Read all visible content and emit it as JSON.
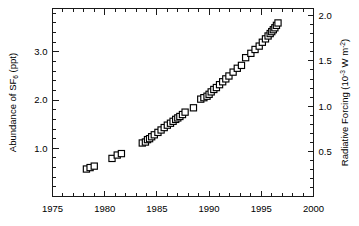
{
  "chart_data": {
    "type": "scatter",
    "title": "",
    "xlabel": "",
    "ylabel": "Abundance of SF6 (ppt)",
    "y2label": "Radiative Forcing (10-3 W m-2)",
    "ylabel_parts": {
      "prefix": "Abundance of SF",
      "subscript": "6",
      "suffix": " (ppt)"
    },
    "y2label_parts": {
      "prefix": "Radiative Forcing (10",
      "exp1": "-3",
      "mid": " W m",
      "exp2": "-2",
      "suffix": ")"
    },
    "xlim": [
      1975,
      2000
    ],
    "ylim": [
      0,
      3.9
    ],
    "y2lim": [
      0,
      2.08
    ],
    "grid": false,
    "legend": null,
    "marker": "open-square",
    "marker_color": "#000000",
    "marker_fill": "#ffffff",
    "xticks": [
      1975,
      1980,
      1985,
      1990,
      1995,
      2000
    ],
    "xtick_labels": [
      "1975",
      "1980",
      "1985",
      "1990",
      "1995",
      "2000"
    ],
    "xminor_step": 1,
    "yticks": [
      1.0,
      2.0,
      3.0
    ],
    "ytick_labels": [
      "1.0",
      "2.0",
      "3.0"
    ],
    "yminor_step": 0.2,
    "y2ticks": [
      0.5,
      1.0,
      1.5,
      2.0
    ],
    "y2tick_labels": [
      "0.5",
      "1.0",
      "1.5",
      "2.0"
    ],
    "y2minor_step": 0.1,
    "x": [
      1978.25,
      1978.6,
      1979.0,
      1980.7,
      1981.2,
      1981.6,
      1983.6,
      1983.9,
      1984.1,
      1984.3,
      1984.5,
      1984.75,
      1985.1,
      1985.4,
      1985.7,
      1986.0,
      1986.3,
      1986.55,
      1986.8,
      1987.0,
      1987.2,
      1987.45,
      1987.7,
      1988.5,
      1989.2,
      1989.5,
      1989.8,
      1990.0,
      1990.2,
      1990.45,
      1990.7,
      1991.0,
      1991.3,
      1991.6,
      1991.9,
      1992.3,
      1992.7,
      1993.1,
      1993.5,
      1994.0,
      1994.4,
      1994.8,
      1995.1,
      1995.4,
      1995.65,
      1995.85,
      1996.0,
      1996.15,
      1996.3,
      1996.45,
      1996.6
    ],
    "y": [
      0.57,
      0.6,
      0.63,
      0.79,
      0.86,
      0.89,
      1.11,
      1.13,
      1.18,
      1.2,
      1.24,
      1.28,
      1.33,
      1.38,
      1.43,
      1.48,
      1.52,
      1.56,
      1.6,
      1.63,
      1.66,
      1.7,
      1.75,
      1.84,
      2.02,
      2.05,
      2.08,
      2.12,
      2.17,
      2.22,
      2.26,
      2.32,
      2.38,
      2.44,
      2.5,
      2.58,
      2.66,
      2.72,
      2.88,
      2.97,
      3.05,
      3.12,
      3.2,
      3.27,
      3.33,
      3.38,
      3.42,
      3.46,
      3.5,
      3.55,
      3.6
    ]
  },
  "colors": {
    "axis": "#1a1a1a",
    "marker": "#000000",
    "background": "#ffffff"
  }
}
